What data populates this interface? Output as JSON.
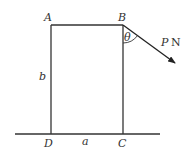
{
  "diagram": {
    "type": "statics-rectangle-force",
    "vertices": {
      "A": {
        "label": "A"
      },
      "B": {
        "label": "B"
      },
      "C": {
        "label": "C"
      },
      "D": {
        "label": "D"
      }
    },
    "dimensions": {
      "width_label": "a",
      "height_label": "b"
    },
    "force": {
      "label_var": "P",
      "label_unit": "N",
      "angle_label": "θ",
      "applied_at": "B"
    },
    "colors": {
      "line": "#333333",
      "background": "#ffffff"
    }
  }
}
